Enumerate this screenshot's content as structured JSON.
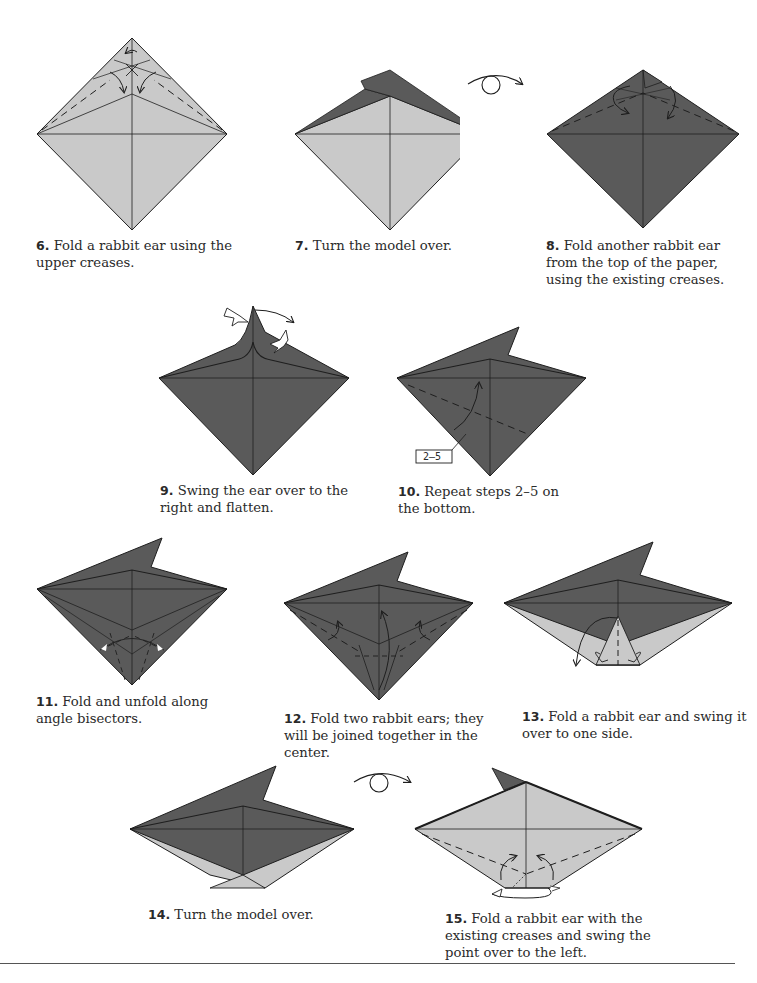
{
  "colors": {
    "paper_light": "#c9c9c9",
    "paper_dark": "#5a5a5a",
    "line": "#1e1e1e",
    "background": "#ffffff"
  },
  "steps": [
    {
      "number": "6.",
      "text": "Fold a rabbit ear using the upper creases.",
      "lines": [
        "Fold a rabbit ear using the",
        "upper creases."
      ]
    },
    {
      "number": "7.",
      "text": "Turn the model over.",
      "lines": [
        "Turn the model over."
      ]
    },
    {
      "number": "8.",
      "text": "Fold another rabbit ear from the top of the paper, using the existing creases.",
      "lines": [
        "Fold another rabbit ear from",
        "the top of the paper, using the",
        "existing creases."
      ]
    },
    {
      "number": "9.",
      "text": "Swing the ear over to the right and flatten.",
      "lines": [
        "Swing the ear over to the",
        "right and flatten."
      ]
    },
    {
      "number": "10.",
      "text": "Repeat steps 2–5 on the bottom.",
      "lines": [
        "Repeat steps 2–5 on",
        "the bottom."
      ],
      "reference_label": "2–5"
    },
    {
      "number": "11.",
      "text": "Fold and unfold along angle bisectors.",
      "lines": [
        "Fold and unfold along",
        "angle bisectors."
      ]
    },
    {
      "number": "12.",
      "text": "Fold two rabbit ears; they will be joined together in the center.",
      "lines": [
        "Fold two rabbit ears; they",
        "will be joined together in the",
        "center."
      ]
    },
    {
      "number": "13.",
      "text": "Fold a rabbit ear and swing it over to one side.",
      "lines": [
        "Fold a rabbit ear and swing it",
        "over to one side."
      ]
    },
    {
      "number": "14.",
      "text": "Turn the model over.",
      "lines": [
        "Turn the model over."
      ]
    },
    {
      "number": "15.",
      "text": "Fold a rabbit ear with the existing creases and swing the point over to the left.",
      "lines": [
        "Fold a rabbit ear with the",
        "existing creases and swing the",
        "point over to the left."
      ]
    }
  ],
  "symbols": {
    "turn_over_icons": [
      "turn-over between steps 7 and 8",
      "turn-over between steps 14 and 15"
    ]
  }
}
